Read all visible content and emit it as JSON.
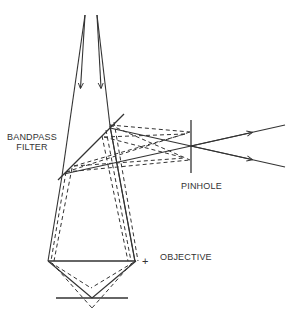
{
  "diagram": {
    "type": "optical-path-diagram",
    "labels": {
      "bandpass_line1": "BANDPASS",
      "bandpass_line2": "FILTER",
      "pinhole": "PINHOLE",
      "objective": "OBJECTIVE",
      "objective_marker": "+"
    },
    "components": [
      {
        "name": "incoming-beam",
        "description": "Two converging rays from top crossing then diverging downward with arrows"
      },
      {
        "name": "bandpass-filter",
        "description": "Tilted line (beam splitter / dichroic) reflecting rays to the right"
      },
      {
        "name": "pinhole",
        "description": "Vertical aperture where reflected solid rays focus"
      },
      {
        "name": "objective",
        "description": "Horizontal lens line"
      },
      {
        "name": "sample-plane",
        "description": "Horizontal line below objective with focal V"
      }
    ],
    "line_styles": {
      "solid": "illumination/focused path",
      "dashed": "out-of-focus path"
    },
    "colors": {
      "ink": "#333333",
      "background": "#ffffff"
    }
  }
}
